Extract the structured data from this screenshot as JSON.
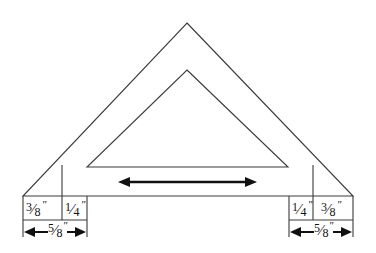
{
  "figure": {
    "background_color": "#ffffff",
    "line_color": "#3a3a3a",
    "dim_color": "#111111"
  },
  "shapes": {
    "outer_triangle": {
      "name": "outer-triangle",
      "apex": [
        187,
        23
      ],
      "left_vertex": [
        23,
        196
      ],
      "right_vertex": [
        353,
        196
      ]
    },
    "inner_triangle": {
      "name": "inner-triangle",
      "apex": [
        187,
        70
      ],
      "left_vertex": [
        87,
        167
      ],
      "right_vertex": [
        288,
        167
      ]
    }
  },
  "annotations": {
    "width_arrow": {
      "name": "inner-width-double-arrow",
      "label": "",
      "x_start": 120,
      "x_end": 255,
      "y": 182,
      "style": "double-headed"
    }
  },
  "dimensions": {
    "left": {
      "segments": [
        {
          "whole": "",
          "numerator": "3",
          "denominator": "8",
          "unit": "″"
        },
        {
          "whole": "",
          "numerator": "1",
          "denominator": "4",
          "unit": "″"
        }
      ],
      "total": {
        "whole": "",
        "numerator": "5",
        "denominator": "8",
        "unit": "″"
      },
      "extension_x": [
        23,
        62,
        87
      ]
    },
    "right": {
      "segments": [
        {
          "whole": "",
          "numerator": "1",
          "denominator": "4",
          "unit": "″"
        },
        {
          "whole": "",
          "numerator": "3",
          "denominator": "8",
          "unit": "″"
        }
      ],
      "total": {
        "whole": "",
        "numerator": "5",
        "denominator": "8",
        "unit": "″"
      },
      "extension_x": [
        289,
        313,
        353
      ]
    },
    "baseline_y": 196,
    "label_row_y": 212,
    "total_row_y": 232,
    "extension_bottom_y": 237
  }
}
